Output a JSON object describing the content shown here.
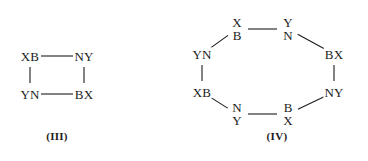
{
  "figure": {
    "background_color": "#ffffff",
    "ink_color": "#1c1c1c",
    "structures": [
      {
        "id": "structure-iii",
        "caption": "(III)",
        "ring_type": "four-membered ring",
        "vertices": [
          {
            "name": "vertex-top-left",
            "label": "XB",
            "layout": "inline",
            "x": 30,
            "y": 56
          },
          {
            "name": "vertex-top-right",
            "label": "NY",
            "layout": "inline",
            "x": 84,
            "y": 56
          },
          {
            "name": "vertex-bottom-left",
            "label": "YN",
            "layout": "inline",
            "x": 30,
            "y": 94
          },
          {
            "name": "vertex-bottom-right",
            "label": "BX",
            "layout": "inline",
            "x": 84,
            "y": 94
          }
        ],
        "bonds": [
          {
            "from": "vertex-top-left",
            "to": "vertex-top-right"
          },
          {
            "from": "vertex-top-right",
            "to": "vertex-bottom-right"
          },
          {
            "from": "vertex-bottom-right",
            "to": "vertex-bottom-left"
          },
          {
            "from": "vertex-bottom-left",
            "to": "vertex-top-left"
          }
        ],
        "caption_x": 57,
        "caption_y": 136
      },
      {
        "id": "structure-iv",
        "caption": "(IV)",
        "ring_type": "eight-membered ring",
        "vertices": [
          {
            "name": "vertex-top-left-b",
            "main": "B",
            "sub": "X",
            "sub_position": "above",
            "layout": "stacked",
            "x": 237,
            "y": 29
          },
          {
            "name": "vertex-top-right-n",
            "main": "N",
            "sub": "Y",
            "sub_position": "above",
            "layout": "stacked",
            "x": 288,
            "y": 29
          },
          {
            "name": "vertex-right-upper-bx",
            "label": "BX",
            "layout": "inline",
            "x": 334,
            "y": 54
          },
          {
            "name": "vertex-right-lower-ny",
            "label": "NY",
            "layout": "inline",
            "x": 334,
            "y": 92
          },
          {
            "name": "vertex-bottom-right-b",
            "main": "B",
            "sub": "X",
            "sub_position": "below",
            "layout": "stacked",
            "x": 288,
            "y": 114
          },
          {
            "name": "vertex-bottom-left-n",
            "main": "N",
            "sub": "Y",
            "sub_position": "below",
            "layout": "stacked",
            "x": 237,
            "y": 114
          },
          {
            "name": "vertex-left-lower-xb",
            "label": "XB",
            "layout": "inline",
            "x": 202,
            "y": 92
          },
          {
            "name": "vertex-left-upper-yn",
            "label": "YN",
            "layout": "inline",
            "x": 202,
            "y": 54
          }
        ],
        "bonds": [
          {
            "from": "vertex-top-left-b",
            "to": "vertex-top-right-n"
          },
          {
            "from": "vertex-top-right-n",
            "to": "vertex-right-upper-bx"
          },
          {
            "from": "vertex-right-upper-bx",
            "to": "vertex-right-lower-ny"
          },
          {
            "from": "vertex-right-lower-ny",
            "to": "vertex-bottom-right-b"
          },
          {
            "from": "vertex-bottom-right-b",
            "to": "vertex-bottom-left-n"
          },
          {
            "from": "vertex-bottom-left-n",
            "to": "vertex-left-lower-xb"
          },
          {
            "from": "vertex-left-lower-xb",
            "to": "vertex-left-upper-yn"
          },
          {
            "from": "vertex-left-upper-yn",
            "to": "vertex-top-left-b"
          }
        ],
        "caption_x": 277,
        "caption_y": 136
      }
    ]
  }
}
